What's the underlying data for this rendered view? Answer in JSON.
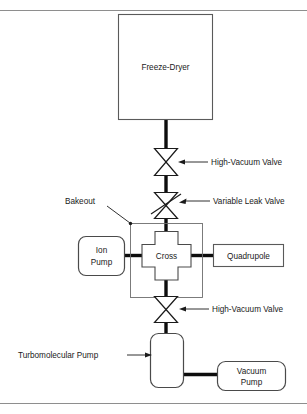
{
  "diagram": {
    "components": [
      {
        "id": "freeze_dryer",
        "label": "Freeze-Dryer",
        "shape": "rectangle"
      },
      {
        "id": "cross",
        "label": "Cross",
        "shape": "cross-polygon"
      },
      {
        "id": "ion_pump",
        "label_line1": "Ion",
        "label_line2": "Pump",
        "shape": "rounded-rectangle"
      },
      {
        "id": "quadrupole",
        "label": "Quadrupole",
        "shape": "rectangle"
      },
      {
        "id": "turbo_pump",
        "label": "Turbomolecular Pump",
        "shape": "rounded-rectangle"
      },
      {
        "id": "vacuum_pump",
        "label_line1": "Vacuum",
        "label_line2": "Pump",
        "shape": "rounded-rectangle"
      }
    ],
    "valves": [
      {
        "id": "hv_valve_top",
        "label": "High-Vacuum Valve",
        "symbol": "bowtie"
      },
      {
        "id": "leak_valve",
        "label": "Variable Leak Valve",
        "symbol": "bowtie-adjustable"
      },
      {
        "id": "hv_valve_bottom",
        "label": "High-Vacuum Valve",
        "symbol": "bowtie"
      }
    ],
    "annotations": [
      {
        "id": "bakeout",
        "label": "Bakeout",
        "symbol": "enclosure-boundary"
      }
    ],
    "labels": {
      "freeze_dryer": "Freeze-Dryer",
      "cross": "Cross",
      "ion_pump_l1": "Ion",
      "ion_pump_l2": "Pump",
      "quadrupole": "Quadrupole",
      "turbo_pump": "Turbomolecular Pump",
      "vacuum_pump_l1": "Vacuum",
      "vacuum_pump_l2": "Pump",
      "hv_valve_top": "High-Vacuum Valve",
      "variable_leak_valve": "Variable Leak Valve",
      "hv_valve_bottom": "High-Vacuum Valve",
      "bakeout": "Bakeout"
    },
    "colors": {
      "pipe": "#0d0d0d",
      "shape_stroke": "#4a4a4a",
      "text": "#1a1a1a",
      "background": "#ffffff",
      "frame": "#8e8e8e"
    }
  }
}
